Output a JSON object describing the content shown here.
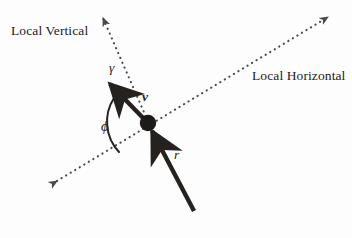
{
  "figure": {
    "background_color": "#fdfdfd",
    "ink_color": "#24211f"
  },
  "labels": {
    "local_vertical": "Local Vertical",
    "local_horizontal": "Local Horizontal",
    "gamma": "γ",
    "velocity": "v",
    "phi": "ϕ",
    "radius": "r",
    "mass_point": "M"
  },
  "geometry": {
    "origin_point": {
      "x": 148,
      "y": 123,
      "radius": 8
    },
    "local_vertical_axis": {
      "style": "dotted",
      "from": {
        "x": 99,
        "y": 13
      },
      "to": {
        "x": 148,
        "y": 123
      },
      "arrowheads": [
        "from"
      ]
    },
    "local_horizontal_axis": {
      "style": "dotted",
      "from": {
        "x": 53,
        "y": 184
      },
      "to": {
        "x": 332,
        "y": 15
      },
      "arrowheads": [
        "from",
        "to"
      ]
    },
    "velocity_vector": {
      "style": "solid",
      "from": {
        "x": 148,
        "y": 123
      },
      "to": {
        "x": 106,
        "y": 80
      },
      "arrowheads": [
        "to"
      ]
    },
    "radius_vector": {
      "style": "solid",
      "from": {
        "x": 194,
        "y": 211
      },
      "to": {
        "x": 148,
        "y": 123
      },
      "arrowheads": [
        "to"
      ]
    },
    "phi_arc": {
      "center": {
        "x": 148,
        "y": 123
      },
      "radius": 40,
      "start_angle_deg": 225,
      "end_angle_deg": 149
    }
  }
}
